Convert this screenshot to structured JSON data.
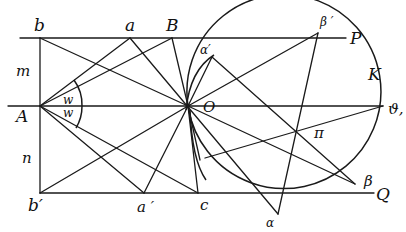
{
  "figure": {
    "type": "geometric-construction",
    "colors": {
      "ink": "#1a1a1a",
      "background": "#ffffff"
    },
    "labels": {
      "b": "b",
      "a": "a",
      "B": "B",
      "P": "P",
      "beta_prime": "β ′",
      "alpha_prime": "α′",
      "K": "K",
      "m": "m",
      "A": "A",
      "w_upper": "w",
      "w_lower": "w",
      "O": "O",
      "theta1": "ϑ,",
      "pi": "π",
      "n": "n",
      "b_prime": "b′",
      "a_prime": "a ′",
      "c": "c",
      "alpha": "α",
      "beta": "β",
      "Q": "Q"
    },
    "points": {
      "b": [
        40,
        38
      ],
      "a": [
        130,
        38
      ],
      "B": [
        172,
        38
      ],
      "A": [
        40,
        106
      ],
      "O": [
        188,
        106
      ],
      "b_prime": [
        40,
        193
      ],
      "a_prime": [
        144,
        193
      ],
      "c": [
        198,
        193
      ],
      "beta_prime": [
        318,
        33
      ],
      "alpha_prime": [
        212,
        57
      ],
      "theta1": [
        383,
        106
      ],
      "alpha": [
        278,
        214
      ],
      "beta": [
        355,
        184
      ],
      "pi": [
        312,
        133
      ]
    }
  }
}
